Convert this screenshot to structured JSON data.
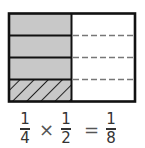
{
  "diagram": {
    "rows": 4,
    "columns": 2,
    "shaded_rows_left": 3,
    "hatched_row_left": 4,
    "colors": {
      "shade": "#c8c8c8",
      "border": "#111111",
      "dash": "#777777",
      "background": "#ffffff"
    }
  },
  "equation": {
    "fraction1": {
      "numerator": "1",
      "denominator": "4"
    },
    "operator1": "×",
    "fraction2": {
      "numerator": "1",
      "denominator": "2"
    },
    "operator2": "=",
    "result": {
      "numerator": "1",
      "denominator": "8"
    }
  }
}
